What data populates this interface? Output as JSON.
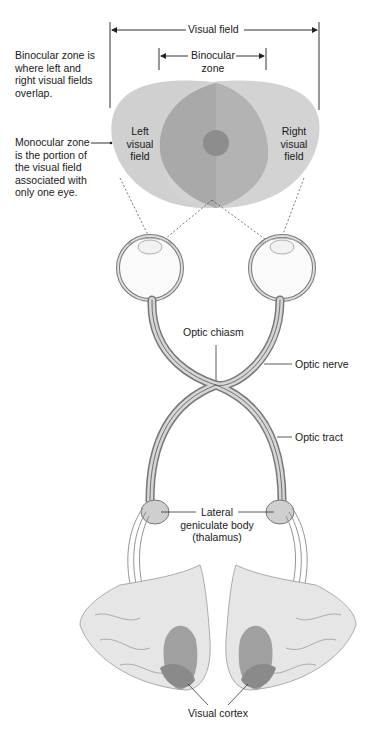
{
  "diagram": {
    "title_fragment": "",
    "labels": {
      "visual_field": "Visual field",
      "binocular_zone_line1": "Binocular",
      "binocular_zone_line2": "zone",
      "binocular_desc": [
        "Binocular zone is",
        "where left and",
        "right visual fields",
        "overlap."
      ],
      "monocular_desc": [
        "Monocular zone",
        "is the portion of",
        "the visual field",
        "associated with",
        "only one eye."
      ],
      "left_field": [
        "Left",
        "visual",
        "field"
      ],
      "right_field": [
        "Right",
        "visual",
        "field"
      ],
      "optic_chiasm": "Optic chiasm",
      "optic_nerve": "Optic nerve",
      "optic_tract": "Optic tract",
      "lgn": [
        "Lateral",
        "geniculate body",
        "(thalamus)"
      ],
      "visual_cortex": "Visual cortex"
    },
    "colors": {
      "field_light": "#d0d0d0",
      "field_overlap": "#a8a8a8",
      "field_overlap_right": "#b4b4b4",
      "fovea": "#8e8e8e",
      "line": "#333333",
      "nerve_fill": "#cfcfcf",
      "brain_fill": "#e6e6e6",
      "cortex": "#9a9a9a"
    }
  }
}
